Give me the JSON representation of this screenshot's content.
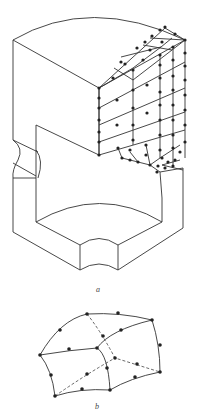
{
  "figure": {
    "part_a": {
      "label": "a",
      "description": "Isometric solid with partial 20-node brick finite element mesh"
    },
    "part_b": {
      "label": "b",
      "description": "Single 20-node quadratic isoparametric brick element"
    }
  }
}
